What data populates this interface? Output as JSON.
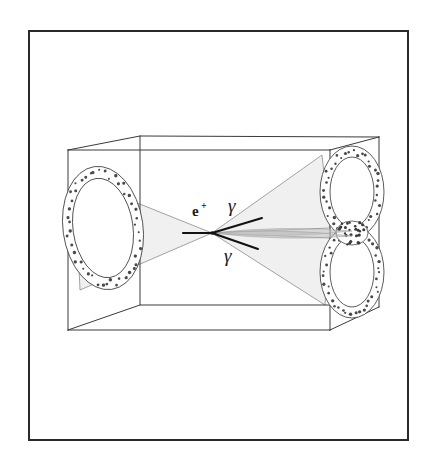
{
  "figure": {
    "domain": "Diagram",
    "background_color": "#ffffff",
    "frame": {
      "name": "outer-border",
      "stroke_color": "#2a2a2a",
      "stroke_width": 2,
      "x": 29,
      "y": 31,
      "width": 379,
      "height": 409
    }
  },
  "detector_box": {
    "name": "detector-volume-box",
    "stroke_color": "#3a3a3a",
    "stroke_width": 1,
    "vertices": {
      "front_top_left": [
        68,
        150
      ],
      "front_top_right": [
        330,
        150
      ],
      "front_bottom_left": [
        68,
        330
      ],
      "front_bottom_right": [
        330,
        330
      ],
      "back_top_left": [
        140,
        136
      ],
      "back_top_right": [
        379,
        137
      ],
      "back_bottom_left": [
        140,
        305
      ],
      "back_bottom_right": [
        379,
        307
      ]
    },
    "interior_edges": [
      {
        "name": "vertical-inner-edge-left",
        "x1": 140,
        "y1": 136,
        "x2": 140,
        "y2": 305
      },
      {
        "name": "horizontal-inner-edge-back",
        "x1": 140,
        "y1": 305,
        "x2": 330,
        "y2": 305
      }
    ]
  },
  "rings": {
    "left": {
      "name": "cherenkov-ring-left",
      "label": "single ring",
      "center": [
        103,
        228
      ],
      "outer_rx": 40,
      "outer_ry": 62,
      "inner_rx": 30,
      "inner_ry": 50,
      "rotation_deg": -8,
      "stipple_color": "#4a4a4a",
      "stroke_color": "#4a4a4a",
      "dot_count": 46
    },
    "right_upper": {
      "name": "cherenkov-ring-right-upper",
      "center": [
        352,
        192
      ],
      "outer_rx": 32,
      "outer_ry": 46,
      "inner_rx": 22,
      "inner_ry": 35,
      "rotation_deg": 0,
      "stipple_color": "#4a4a4a",
      "stroke_color": "#4a4a4a",
      "dot_count": 40
    },
    "right_lower": {
      "name": "cherenkov-ring-right-lower",
      "center": [
        352,
        272
      ],
      "outer_rx": 32,
      "outer_ry": 46,
      "inner_rx": 22,
      "inner_ry": 35,
      "rotation_deg": 0,
      "stipple_color": "#4a4a4a",
      "stroke_color": "#4a4a4a",
      "dot_count": 40
    },
    "overlap_patch": {
      "name": "ring-overlap-region",
      "center": [
        352,
        233
      ],
      "rx": 16,
      "ry": 12,
      "stipple_color": "#3a3a3a",
      "dot_count": 26
    }
  },
  "vertex": {
    "name": "interaction-vertex",
    "x": 212,
    "y": 233
  },
  "cones": {
    "left_cone": {
      "name": "cherenkov-cone-left",
      "fill_color": "#ededed",
      "stroke_color": "#8c8c8c",
      "apex": [
        212,
        233
      ],
      "base_top": [
        75,
        178
      ],
      "base_bottom": [
        80,
        290
      ]
    },
    "right_cone_upper": {
      "name": "cherenkov-cone-right-upper",
      "fill_color": "#ededed",
      "stroke_color": "#8c8c8c",
      "apex": [
        212,
        233
      ],
      "base_top": [
        322,
        155
      ],
      "base_bottom": [
        330,
        228
      ]
    },
    "right_cone_lower": {
      "name": "cherenkov-cone-right-lower",
      "fill_color": "#ededed",
      "stroke_color": "#8c8c8c",
      "apex": [
        212,
        233
      ],
      "base_top": [
        330,
        238
      ],
      "base_bottom": [
        325,
        305
      ]
    },
    "gamma_beam_upper": {
      "name": "gamma-beam-upper",
      "fill_color": "#bdbdbd",
      "apex": [
        212,
        233
      ],
      "tip": [
        352,
        231
      ],
      "max_half_width": 7
    },
    "gamma_beam_lower": {
      "name": "gamma-beam-lower",
      "fill_color": "#bdbdbd",
      "apex": [
        212,
        233
      ],
      "tip": [
        352,
        236
      ],
      "max_half_width": 7
    }
  },
  "tracks": [
    {
      "name": "positron-track",
      "particle": "e+",
      "stroke_color": "#111111",
      "stroke_width": 2.2,
      "x1": 183,
      "y1": 233,
      "x2": 212,
      "y2": 233
    },
    {
      "name": "gamma-track-upper",
      "particle": "gamma",
      "stroke_color": "#111111",
      "stroke_width": 2.0,
      "x1": 212,
      "y1": 233,
      "x2": 262,
      "y2": 218
    },
    {
      "name": "gamma-track-lower",
      "particle": "gamma",
      "stroke_color": "#111111",
      "stroke_width": 2.0,
      "x1": 212,
      "y1": 233,
      "x2": 258,
      "y2": 249
    }
  ],
  "labels": {
    "positron": {
      "name": "label-positron",
      "text": "e",
      "superscript": "+",
      "x": 192,
      "y": 216
    },
    "gamma_upper": {
      "name": "label-gamma-upper",
      "text": "γ",
      "x": 228,
      "y": 212
    },
    "gamma_lower": {
      "name": "label-gamma-lower",
      "text": "γ",
      "x": 224,
      "y": 262
    }
  },
  "colors": {
    "ink": "#2a2a2a",
    "line": "#3a3a3a",
    "cone_fill": "#ededed",
    "cone_stroke": "#8c8c8c",
    "beam_fill": "#bdbdbd",
    "stipple": "#4a4a4a",
    "background": "#ffffff"
  }
}
